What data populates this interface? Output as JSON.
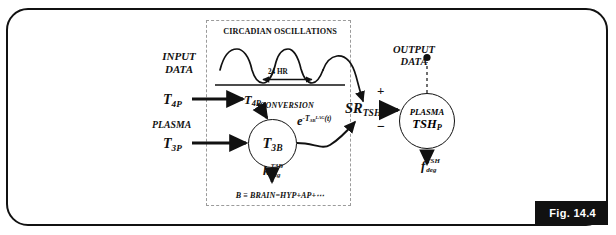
{
  "figure": {
    "label": "Fig. 14.4",
    "domain": "physiological-model-block-diagram"
  },
  "labels": {
    "input_data_line1": "INPUT",
    "input_data_line2": "DATA",
    "output_data_line1": "OUTPUT",
    "output_data_line2": "DATA",
    "plasma": "PLASMA",
    "conversion": "CONVERSION",
    "circadian_title": "CIRCADIAN OSCILLATIONS",
    "period_annotation": "24 HR",
    "brain_definition": "B ≡ BRAIN=HYP+AP+⋯"
  },
  "variables": {
    "t4p": {
      "base": "T",
      "sub": "4P"
    },
    "t3p": {
      "base": "T",
      "sub": "3P"
    },
    "t4b": {
      "base": "T",
      "sub": "4B"
    },
    "t3b": {
      "base": "T",
      "sub": "3B"
    },
    "sr_tsh": {
      "base": "SR",
      "sub": "TSH"
    },
    "exp_term": {
      "base": "e",
      "exp_prefix": "-T",
      "exp_sub": "3B",
      "exp_sup": "LAG",
      "exp_arg": "(t)"
    },
    "k_deg": {
      "base": "k",
      "sub": "deg",
      "sup": "T3B"
    },
    "f_deg": {
      "base": "f",
      "sub": "deg",
      "sup": "TSH"
    },
    "plasma_tsh_line1": "PLASMA",
    "plasma_tsh_line2": {
      "base": "TSH",
      "sub": "P"
    }
  },
  "signs": {
    "positive": "+",
    "negative": "−"
  },
  "colors": {
    "stroke": "#111111",
    "dashed_border": "#9b9b9b",
    "background": "#ffffff",
    "fig_label_bg": "#111111",
    "fig_label_text": "#ffffff"
  }
}
